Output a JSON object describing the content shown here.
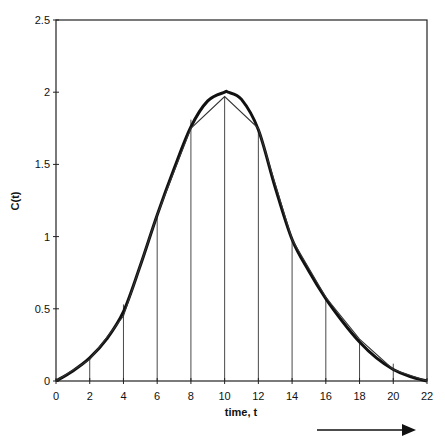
{
  "chart_data": {
    "type": "line",
    "title": "",
    "xlabel": "time, t",
    "ylabel": "C(t)",
    "xlim": [
      0,
      22
    ],
    "ylim": [
      0,
      2.5
    ],
    "x_ticks": [
      0,
      2,
      4,
      6,
      8,
      10,
      12,
      14,
      16,
      18,
      20,
      22
    ],
    "x_tick_labels": [
      "0",
      "2",
      "4",
      "6",
      "8",
      "10",
      "12",
      "14",
      "16",
      "18",
      "20",
      "22"
    ],
    "y_ticks": [
      0,
      0.5,
      1,
      1.5,
      2,
      2.5
    ],
    "y_tick_labels": [
      "0",
      "0.5",
      "1",
      "1.5",
      "2",
      "2.5"
    ],
    "grid": false,
    "series": [
      {
        "name": "C(t) smooth curve",
        "style": "thick-smooth",
        "x": [
          0,
          1,
          2,
          3,
          4,
          5,
          6,
          7,
          8,
          9,
          10,
          10.2,
          11,
          12,
          13,
          14,
          15,
          16,
          17,
          18,
          19,
          20,
          21,
          22
        ],
        "values": [
          0,
          0.07,
          0.16,
          0.29,
          0.48,
          0.8,
          1.15,
          1.47,
          1.76,
          1.94,
          2.0,
          2.0,
          1.95,
          1.74,
          1.34,
          0.98,
          0.76,
          0.57,
          0.41,
          0.27,
          0.16,
          0.08,
          0.03,
          0
        ]
      },
      {
        "name": "trapezoid approximation",
        "style": "thin-polyline",
        "x": [
          0,
          2,
          4,
          6,
          8,
          10,
          12,
          14,
          16,
          18,
          20,
          22
        ],
        "values": [
          0,
          0.15,
          0.45,
          1.15,
          1.75,
          1.97,
          1.75,
          0.98,
          0.58,
          0.29,
          0.08,
          0
        ]
      }
    ],
    "ordinates": {
      "x": [
        2,
        4,
        6,
        8,
        10,
        12,
        14,
        16,
        18,
        20
      ],
      "values": [
        0.15,
        0.53,
        1.15,
        1.81,
        1.97,
        1.75,
        0.98,
        0.58,
        0.29,
        0.12
      ]
    },
    "annotations": [
      {
        "type": "arrow",
        "direction": "right",
        "meaning": "increasing time"
      }
    ],
    "legend": "none"
  }
}
